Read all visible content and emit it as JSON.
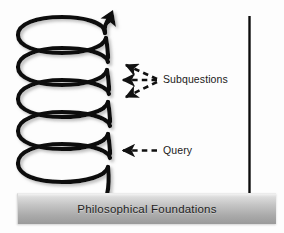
{
  "figure": {
    "background_color": "#fdfdfd",
    "stroke_color": "#111111",
    "annotations": {
      "subquestions": {
        "label": "Subquestions",
        "arrow_count": 3,
        "arrow_style": "dashed",
        "icon": "dashed-arrow-left-icon"
      },
      "query": {
        "label": "Query",
        "arrow_count": 1,
        "arrow_style": "dashed",
        "icon": "dashed-arrow-left-icon"
      }
    },
    "spiral": {
      "name": "ascending-spiral",
      "loop_count": 5,
      "direction": "upward",
      "tip_icon": "arrowhead-up-icon",
      "stroke_color": "#111111"
    },
    "vertical_axis": {
      "name": "vertical-line",
      "color": "#0d0d0d"
    },
    "foundation": {
      "label": "Philosophical Foundations",
      "fill_top_color": "#f2f2f2",
      "fill_bottom_color": "#9a9a9a",
      "text_color": "#1e1e1e"
    }
  }
}
